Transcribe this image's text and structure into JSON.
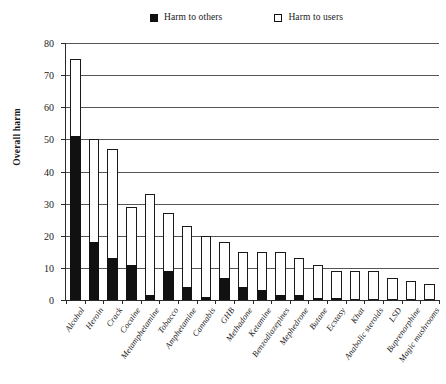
{
  "legend": {
    "entries": [
      {
        "label": "Harm to others",
        "swatch": "filled-square-icon"
      },
      {
        "label": "Harm to users",
        "swatch": "open-square-icon"
      }
    ]
  },
  "axes": {
    "y_title": "Overall harm",
    "y_ticks": [
      "0",
      "10",
      "20",
      "30",
      "40",
      "50",
      "60",
      "70",
      "80"
    ]
  },
  "chart_data": {
    "type": "bar",
    "title": "",
    "xlabel": "",
    "ylabel": "Overall harm",
    "ylim": [
      0,
      80
    ],
    "ytick_step": 10,
    "grid": true,
    "stacked": true,
    "legend_position": "top-center",
    "categories": [
      "Alcohol",
      "Heroin",
      "Crack",
      "Cocaine",
      "Metamphetamine",
      "Tobacco",
      "Amphetamine",
      "Cannabis",
      "GHB",
      "Methadone",
      "Ketamine",
      "Benzodiazepines",
      "Mephedrone",
      "Butane",
      "Ecstasy",
      "Khat",
      "Anabolic steroids",
      "LSD",
      "Buprenorphine",
      "Magic mushrooms"
    ],
    "series": [
      {
        "name": "Harm to others",
        "color": "#111111",
        "values": [
          51,
          18,
          13,
          11,
          1.5,
          9,
          4,
          1,
          7,
          4,
          3,
          1.5,
          1.5,
          0.5,
          0.5,
          0,
          0,
          0,
          0,
          0
        ]
      },
      {
        "name": "Harm to users",
        "color": "#ffffff",
        "values": [
          24,
          32,
          34,
          18,
          31.5,
          18,
          19,
          19,
          11,
          11,
          12,
          13.5,
          11.5,
          10.5,
          8.5,
          9,
          9,
          7,
          6,
          5
        ]
      }
    ],
    "totals": [
      75,
      50,
      47,
      29,
      33,
      27,
      23,
      20,
      18,
      15,
      15,
      15,
      13,
      11,
      9,
      9,
      9,
      7,
      6,
      5
    ]
  }
}
